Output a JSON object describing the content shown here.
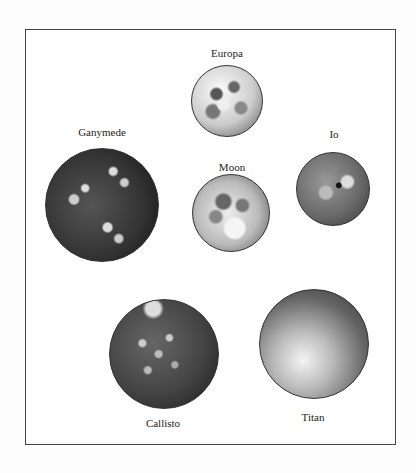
{
  "moons": [
    {
      "name": "Europa",
      "cx": 227,
      "cy": 101,
      "r": 36,
      "label_y": 47
    },
    {
      "name": "Ganymede",
      "cx": 102,
      "cy": 205,
      "r": 57,
      "label_y": 126
    },
    {
      "name": "Io",
      "cx": 333,
      "cy": 189,
      "r": 37,
      "label_y": 128
    },
    {
      "name": "Moon",
      "cx": 231,
      "cy": 213,
      "r": 39,
      "label_y": 161
    },
    {
      "name": "Callisto",
      "cx": 164,
      "cy": 354,
      "r": 55,
      "label_y": 417
    },
    {
      "name": "Titan",
      "cx": 314,
      "cy": 344,
      "r": 55,
      "label_y": 411
    }
  ]
}
